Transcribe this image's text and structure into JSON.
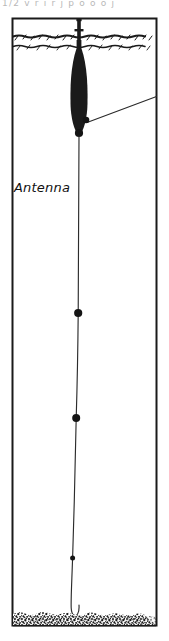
{
  "figure": {
    "clipped_top_caption": "1/2     v   r  i     r   j   p o o o  j",
    "labels": {
      "antenna": "Antenna"
    },
    "colors": {
      "ink": "#141414",
      "buoy_fill": "#1a1a1a",
      "paper": "#ffffff",
      "seabed": "#1a1a1a",
      "faint_line": "#6b6b6b"
    }
  },
  "diagram_data": {
    "type": "technical-illustration",
    "subject": "surface-buoy-mooring",
    "frame": {
      "x": 12,
      "y": 18,
      "width": 145,
      "height": 608
    },
    "water_surface": {
      "line_y_upper": 36,
      "line_y_lower": 46,
      "style": "wavy-hatched"
    },
    "antenna_mast": {
      "x": 79,
      "top_y": 20,
      "bottom_y": 48,
      "crossbar_y": 30,
      "crossbar_half_width": 4
    },
    "buoy": {
      "center_x": 79,
      "top_y": 42,
      "bottom_y": 136,
      "max_half_width": 8,
      "shape": "spar-elongated-ellipse",
      "fill": "solid-black"
    },
    "tether_line": {
      "from": [
        88,
        123
      ],
      "to": [
        157,
        97
      ],
      "style": "straight-thin"
    },
    "junction_nodes": [
      {
        "x": 86,
        "y": 120,
        "r": 3.2
      },
      {
        "x": 79,
        "y": 133,
        "r": 4.0
      }
    ],
    "mooring_cable": {
      "points": [
        [
          79,
          137
        ],
        [
          79,
          250
        ],
        [
          78,
          313
        ],
        [
          77,
          380
        ],
        [
          76,
          418
        ],
        [
          74,
          500
        ],
        [
          72,
          558
        ],
        [
          71,
          600
        ],
        [
          73,
          614
        ],
        [
          77,
          616
        ],
        [
          79,
          608
        ]
      ],
      "terminates_in": "hook-curve-at-seabed"
    },
    "instrument_nodes": [
      {
        "x": 78,
        "y": 313,
        "r": 4.0
      },
      {
        "x": 76,
        "y": 418,
        "r": 4.0
      },
      {
        "x": 72,
        "y": 558,
        "r": 2.4
      }
    ],
    "seabed": {
      "top_y": 612,
      "bottom_y": 626,
      "texture": "stipple-speckle"
    }
  }
}
